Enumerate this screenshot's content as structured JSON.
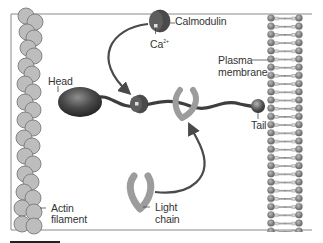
{
  "diagram": {
    "type": "biology-schematic",
    "labels": {
      "calmodulin": "Calmodulin",
      "calcium": "Ca",
      "calcium_charge": "2+",
      "plasma_membrane_line1": "Plasma",
      "plasma_membrane_line2": "membrane",
      "head": "Head",
      "tail": "Tail",
      "actin_line1": "Actin",
      "actin_line2": "filament",
      "light_chain_line1": "Light",
      "light_chain_line2": "chain"
    },
    "colors": {
      "frame": "#8a8a8a",
      "actin": "#bdbdbd",
      "actin_outline": "#7a7a7a",
      "myosin_dark": "#3c3c3c",
      "light_chain": "#a8a8a8",
      "membrane_head": "#8a8a8a",
      "arrow": "#4a4a4a",
      "label_text": "#333333"
    }
  }
}
